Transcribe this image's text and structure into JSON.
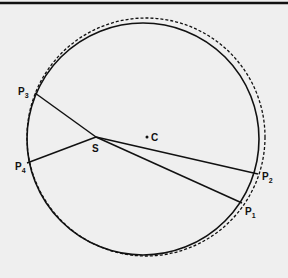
{
  "diagram": {
    "colors": {
      "background": "#efefef",
      "ink": "#111111"
    },
    "top_rule": {
      "y": 3
    },
    "solid_circle": {
      "cx": 143,
      "cy": 139,
      "r": 116
    },
    "dashed_circle": {
      "cx": 146,
      "cy": 137,
      "r": 119
    },
    "center_point": {
      "label": "C",
      "x": 147,
      "y": 137
    },
    "source_point": {
      "label": "S",
      "x": 96,
      "y": 137
    },
    "points": [
      {
        "label": "P",
        "sub": "1",
        "x": 242,
        "y": 203,
        "lx": 245,
        "ly": 215
      },
      {
        "label": "P",
        "sub": "2",
        "x": 258,
        "y": 174,
        "lx": 262,
        "ly": 180
      },
      {
        "label": "P",
        "sub": "3",
        "x": 35,
        "y": 93,
        "lx": 17,
        "ly": 93
      },
      {
        "label": "P",
        "sub": "4",
        "x": 27,
        "y": 163,
        "lx": 15,
        "ly": 170
      }
    ]
  }
}
